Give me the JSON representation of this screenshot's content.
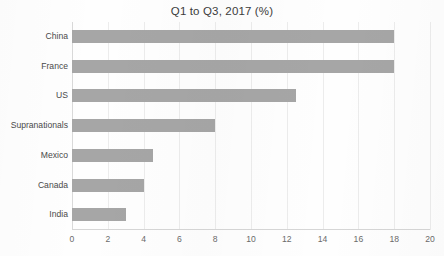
{
  "chart_data": {
    "type": "bar",
    "orientation": "horizontal",
    "title": "Q1 to Q3, 2017 (%)",
    "xlabel": "",
    "ylabel": "",
    "categories": [
      "China",
      "France",
      "US",
      "Supranationals",
      "Mexico",
      "Canada",
      "India"
    ],
    "values": [
      18.0,
      18.0,
      12.5,
      8.0,
      4.5,
      4.0,
      3.0
    ],
    "xlim": [
      0,
      20
    ],
    "xticks": [
      0,
      2,
      4,
      6,
      8,
      10,
      12,
      14,
      16,
      18,
      20
    ],
    "xtick_labels": [
      "0",
      "2",
      "4",
      "6",
      "8",
      "10",
      "12",
      "14",
      "16",
      "18",
      "20"
    ],
    "grid": "vertical",
    "legend": "none",
    "bar_color": "#a6a6a6",
    "gridline_color": "#ececec",
    "title_color": "#3c3c3c",
    "label_color": "#4a4a4a",
    "tick_color": "#6b6b6b"
  }
}
